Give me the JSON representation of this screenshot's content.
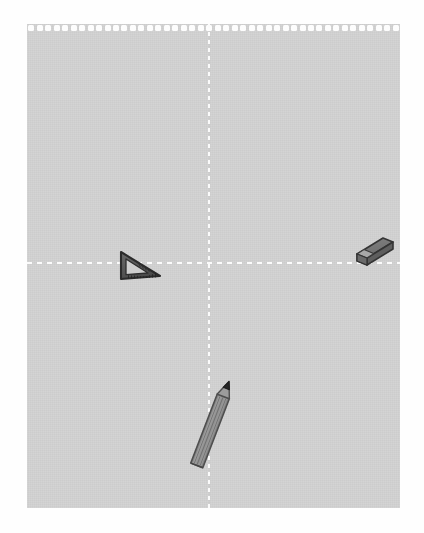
{
  "scene": {
    "title": "Stationery on graph notepad sheet",
    "background_color": "#fefefe"
  },
  "paper": {
    "name": "notepad-sheet",
    "color": "#d0d0d0",
    "perforation_color": "#fdfdfd",
    "perforation_hole_count": 44,
    "fold_line_color": "#fbfbfb"
  },
  "guides": {
    "vertical_label": "vertical fold guide",
    "horizontal_label": "horizontal fold guide"
  },
  "objects": [
    {
      "id": "set-square",
      "label": "Set square",
      "icon": "set-square-icon",
      "body_color": "#5a5a5a",
      "edge_color": "#2e2e2e",
      "position": "left of center on the horizontal fold"
    },
    {
      "id": "eraser",
      "label": "Eraser",
      "icon": "eraser-icon",
      "body_color": "#6b6b6b",
      "top_color": "#7d7d7d",
      "edge_color": "#3a3a3a",
      "position": "right edge on the horizontal fold"
    },
    {
      "id": "pencil",
      "label": "Pencil",
      "icon": "pencil-icon",
      "body_color": "#8f8f8f",
      "tip_color": "#2b2b2b",
      "edge_color": "#4a4a4a",
      "position": "lower center along the vertical fold"
    }
  ]
}
